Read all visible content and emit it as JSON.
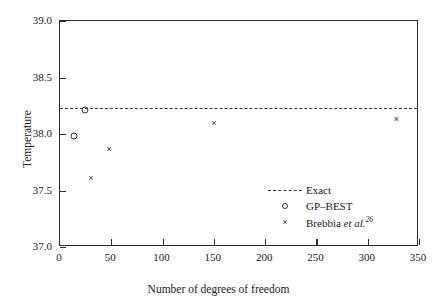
{
  "chart_data": {
    "type": "scatter",
    "title": "",
    "xlabel": "Number of degrees of freedom",
    "ylabel": "Temperature",
    "xlim": [
      0,
      350
    ],
    "ylim": [
      37.0,
      39.0
    ],
    "xticks": [
      0,
      50,
      100,
      150,
      200,
      250,
      300,
      350
    ],
    "xticklabels": [
      "0",
      "50",
      "100",
      "150",
      "200",
      "250",
      "300",
      "350"
    ],
    "yticks": [
      37.0,
      37.5,
      38.0,
      38.5,
      39.0
    ],
    "yticklabels": [
      "37.0",
      "37.5",
      "38.0",
      "38.5",
      "39.0"
    ],
    "grid": false,
    "legend_position": "lower right",
    "series": [
      {
        "name": "Exact",
        "marker": "none",
        "linestyle": "dashed",
        "color": "#333333",
        "type": "hline",
        "value": 38.23
      },
      {
        "name": "GP-BEST",
        "marker": "circle",
        "linestyle": "none",
        "color": "#333333",
        "points": [
          {
            "x": 14,
            "y": 37.98
          },
          {
            "x": 24,
            "y": 38.21
          }
        ]
      },
      {
        "name": "Brebbia et al.",
        "marker": "x",
        "linestyle": "none",
        "color": "#333333",
        "points": [
          {
            "x": 30,
            "y": 37.61
          },
          {
            "x": 48,
            "y": 37.87
          },
          {
            "x": 150,
            "y": 38.1
          },
          {
            "x": 328,
            "y": 38.13
          }
        ]
      }
    ]
  },
  "legend": {
    "entries": [
      {
        "label": "Exact",
        "symbol": "dashed-line"
      },
      {
        "label": "GP–BEST",
        "symbol": "circle"
      },
      {
        "label_prefix": "Brebbia ",
        "label_italic": "et al.",
        "label_sup": "26",
        "symbol": "x-cross"
      }
    ]
  }
}
